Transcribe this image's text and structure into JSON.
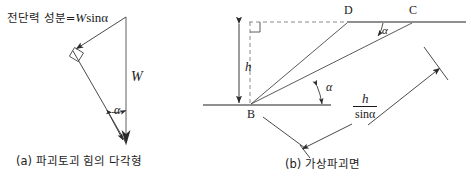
{
  "figure": {
    "title_text": "",
    "background_color": "#ffffff",
    "line_color": "#3a3a3a",
    "text_color": "#1a1a1a"
  },
  "panel_a": {
    "caption": "(a) 파괴토괴 힘의 다각형",
    "shear_label_ko": "전단력 성분=",
    "shear_label_math_w": "W",
    "shear_label_math_sin": "sin",
    "shear_label_math_alpha": "α",
    "weight_label": "W",
    "angle_label": "α"
  },
  "panel_b": {
    "caption": "(b) 가상파괴면",
    "point_b": "B",
    "point_c": "C",
    "point_d": "D",
    "height_label": "h",
    "angle_label_base": "α",
    "angle_label_top": "α",
    "length_numerator": "h",
    "length_denominator": "sinα"
  }
}
